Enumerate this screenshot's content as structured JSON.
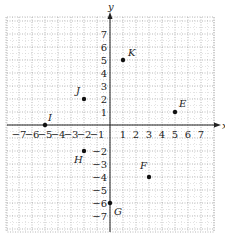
{
  "axes": {
    "x_label": "x",
    "y_label": "y",
    "x_range": [
      -8,
      8
    ],
    "y_range": [
      -8,
      8
    ],
    "x_ticks": [
      -7,
      -6,
      -5,
      -4,
      -3,
      -2,
      -1,
      1,
      2,
      3,
      4,
      5,
      6,
      7
    ],
    "y_ticks": [
      7,
      6,
      5,
      4,
      3,
      2,
      1,
      -2,
      -3,
      -4,
      -5,
      -6,
      -7
    ]
  },
  "points": [
    {
      "label": "K",
      "x": 1,
      "y": 5
    },
    {
      "label": "J",
      "x": -2,
      "y": 2
    },
    {
      "label": "E",
      "x": 5,
      "y": 1
    },
    {
      "label": "I",
      "x": -5,
      "y": 0
    },
    {
      "label": "H",
      "x": -2,
      "y": -2
    },
    {
      "label": "F",
      "x": 3,
      "y": -4
    },
    {
      "label": "G",
      "x": 0,
      "y": -6
    }
  ],
  "colors": {
    "grid": "#9a9a9a",
    "axis": "#222222",
    "point": "#111111"
  }
}
